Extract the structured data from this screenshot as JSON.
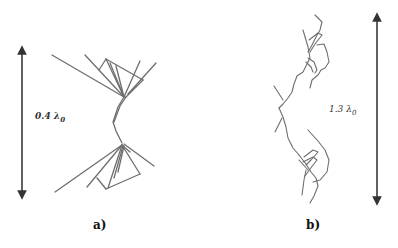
{
  "figure": {
    "panels": [
      {
        "id": "a",
        "label": "a)",
        "dimension": {
          "value": "0.4",
          "unit": "λ",
          "subscript": "0",
          "text": "0.4 λ0"
        }
      },
      {
        "id": "b",
        "label": "b)",
        "dimension": {
          "value": "1.3",
          "unit": "λ",
          "subscript": "0",
          "text": "1.3 λ0"
        }
      }
    ],
    "colors": {
      "wire": "#6e6e6e",
      "arrow": "#3a3a3a",
      "text": "#222222"
    }
  }
}
